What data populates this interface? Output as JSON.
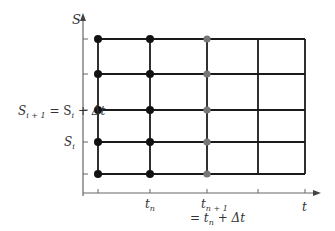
{
  "diagram": {
    "y_axis_label": "S",
    "x_axis_label": "t",
    "y_labels": {
      "s_i_plus_1": {
        "base": "S",
        "sub": "i + 1",
        "rest_eq": " = S",
        "rest_sub": "i",
        "rest_tail": " + Δt"
      },
      "s_i": {
        "base": "S",
        "sub": "i"
      }
    },
    "x_labels": {
      "t_n": {
        "base": "t",
        "sub": "n"
      },
      "t_n_plus_1": {
        "base": "t",
        "sub": "n + 1"
      },
      "t_n_plus_1_eq": {
        "prefix": "= t",
        "sub": "n",
        "tail": " + Δt"
      }
    },
    "grid": {
      "columns_x": [
        98,
        150,
        207,
        258,
        305
      ],
      "rows_y": [
        39,
        74,
        110,
        142,
        174
      ]
    },
    "node_colors": {
      "black": "#111111",
      "gray": "#777777"
    },
    "line_color": "#1a1a1a",
    "axis_color": "#666666"
  }
}
